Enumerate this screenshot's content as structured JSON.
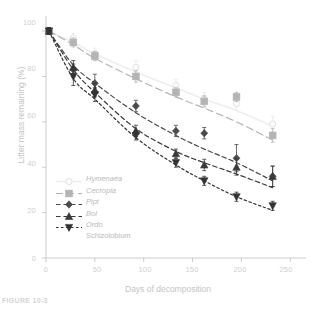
{
  "figure": {
    "caption": "FIGURE 10-3"
  },
  "axes": {
    "x_title": "Days of decomposition",
    "y_title": "Litter mass remaining (%)",
    "x_ticks": [
      "0",
      "50",
      "100",
      "150",
      "200",
      "250"
    ],
    "y_ticks": [
      "0",
      "20",
      "40",
      "60",
      "80",
      "100"
    ]
  },
  "legend": {
    "items": [
      {
        "label": "Hymenaea",
        "marker": "circle-open-icon",
        "color": "#eeeeee",
        "dash": "solid"
      },
      {
        "label": "Cecropia",
        "marker": "square-icon",
        "color": "#b4b4b4",
        "dash": "long-dash"
      },
      {
        "label": "Pipt",
        "marker": "diamond-icon",
        "color": "#4a4a4a",
        "dash": "dash"
      },
      {
        "label": "Bol",
        "marker": "triangle-up-icon",
        "color": "#3a3a3a",
        "dash": "dash"
      },
      {
        "label": "Ordo",
        "marker": "triangle-down-icon",
        "color": "#333333",
        "dash": "short-dash"
      }
    ],
    "continuation": "Schizolobium"
  },
  "chart_data": {
    "type": "line",
    "title": "",
    "xlabel": "Days of decomposition",
    "ylabel": "Litter mass remaining (%)",
    "xlim": [
      0,
      260
    ],
    "ylim": [
      0,
      104
    ],
    "grid": false,
    "legend_position": "lower-left-inside",
    "series": [
      {
        "name": "Hymenaea",
        "color": "#eeeeee",
        "marker": "circle-open-icon",
        "line_style": "solid",
        "x": [
          3,
          28,
          50,
          92,
          133,
          162,
          195,
          232
        ],
        "values": [
          100,
          97,
          90,
          84,
          76,
          70,
          68,
          59
        ],
        "errors": [
          1.5,
          2.0,
          2.5,
          3.0,
          2.5,
          3.0,
          3.0,
          3.5
        ],
        "fit_values": [
          100,
          95,
          90,
          82,
          75,
          70,
          65,
          58
        ]
      },
      {
        "name": "Cecropia",
        "color": "#b4b4b4",
        "marker": "square-icon",
        "line_style": "long-dash",
        "x": [
          3,
          28,
          50,
          92,
          133,
          162,
          195,
          232
        ],
        "values": [
          100,
          95,
          89,
          80,
          73,
          69,
          71,
          54
        ],
        "errors": [
          1.5,
          2.0,
          2.0,
          2.5,
          2.0,
          2.5,
          2.0,
          3.0
        ],
        "fit_values": [
          100,
          94,
          88,
          79,
          71,
          66,
          60,
          52
        ]
      },
      {
        "name": "Pipt",
        "color": "#4a4a4a",
        "marker": "diamond-icon",
        "line_style": "dash",
        "x": [
          3,
          28,
          50,
          92,
          133,
          162,
          195,
          232
        ],
        "values": [
          100,
          83,
          77,
          67,
          56,
          55,
          44,
          36
        ],
        "errors": [
          1.5,
          2.5,
          4.0,
          2.5,
          2.5,
          2.5,
          6.0,
          4.5
        ],
        "fit_values": [
          100,
          85,
          77,
          64,
          54,
          48,
          42,
          34
        ]
      },
      {
        "name": "Bol",
        "color": "#3a3a3a",
        "marker": "triangle-up-icon",
        "line_style": "dash",
        "x": [
          3,
          28,
          50,
          92,
          133,
          162,
          195,
          232
        ],
        "values": [
          100,
          84,
          74,
          56,
          46,
          41,
          40,
          36
        ],
        "errors": [
          1.5,
          3.0,
          3.0,
          2.5,
          2.0,
          2.5,
          3.5,
          4.5
        ],
        "fit_values": [
          100,
          83,
          73,
          57,
          47,
          42,
          37,
          31
        ]
      },
      {
        "name": "Ordo",
        "color": "#333333",
        "marker": "triangle-down-icon",
        "line_style": "short-dash",
        "x": [
          3,
          28,
          50,
          92,
          133,
          162,
          195,
          232
        ],
        "values": [
          100,
          80,
          72,
          54,
          42,
          34,
          27,
          23
        ],
        "errors": [
          1.5,
          4.0,
          3.0,
          2.0,
          2.0,
          2.0,
          2.0,
          2.0
        ],
        "fit_values": [
          100,
          79,
          70,
          53,
          41,
          34,
          27,
          21
        ]
      }
    ]
  }
}
